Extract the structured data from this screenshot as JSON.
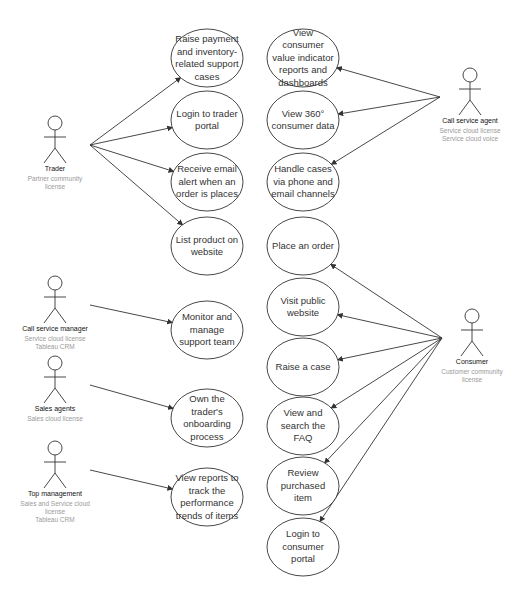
{
  "diagram": {
    "type": "UML use case diagram",
    "actors": [
      {
        "id": "trader",
        "name": "Trader",
        "license": [
          "Partner community",
          "license"
        ],
        "x": 55,
        "y": 145
      },
      {
        "id": "call-service-manager",
        "name": "Call service manager",
        "license": [
          "Service cloud license",
          "Tableau CRM"
        ],
        "x": 55,
        "y": 305
      },
      {
        "id": "sales-agents",
        "name": "Sales agents",
        "license": [
          "Sales cloud license"
        ],
        "x": 55,
        "y": 385
      },
      {
        "id": "top-management",
        "name": "Top management",
        "license": [
          "Sales and Service cloud",
          "license",
          "Tableau CRM"
        ],
        "x": 55,
        "y": 470
      },
      {
        "id": "call-service-agent",
        "name": "Call service agent",
        "license": [
          "Service cloud license",
          "Service cloud voice"
        ],
        "x": 470,
        "y": 97
      },
      {
        "id": "consumer",
        "name": "Consumer",
        "license": [
          "Customer community",
          "license"
        ],
        "x": 472,
        "y": 338
      }
    ],
    "use_cases": [
      {
        "id": "uc1",
        "label": "Raise payment and inventory-related support cases",
        "cx": 207,
        "cy": 58,
        "rx": 36,
        "ry": 29
      },
      {
        "id": "uc2",
        "label": "Login to trader portal",
        "cx": 207,
        "cy": 120,
        "rx": 36,
        "ry": 29
      },
      {
        "id": "uc3",
        "label": "Receive email alert when an order is places",
        "cx": 207,
        "cy": 182,
        "rx": 36,
        "ry": 29
      },
      {
        "id": "uc4",
        "label": "List product on website",
        "cx": 207,
        "cy": 246,
        "rx": 36,
        "ry": 29
      },
      {
        "id": "uc5",
        "label": "Monitor and manage support team",
        "cx": 207,
        "cy": 330,
        "rx": 36,
        "ry": 29
      },
      {
        "id": "uc6",
        "label": "Own the trader's onboarding process",
        "cx": 207,
        "cy": 418,
        "rx": 36,
        "ry": 29
      },
      {
        "id": "uc7",
        "label": "View reports to track the performance trends of items",
        "cx": 207,
        "cy": 497,
        "rx": 36,
        "ry": 29
      },
      {
        "id": "uc8",
        "label": "View consumer value indicator reports and dashboards",
        "cx": 303,
        "cy": 58,
        "rx": 36,
        "ry": 29
      },
      {
        "id": "uc9",
        "label": "View 360° consumer data",
        "cx": 303,
        "cy": 120,
        "rx": 36,
        "ry": 29
      },
      {
        "id": "uc10",
        "label": "Handle cases via phone and email channels",
        "cx": 303,
        "cy": 182,
        "rx": 36,
        "ry": 29
      },
      {
        "id": "uc11",
        "label": "Place an order",
        "cx": 303,
        "cy": 246,
        "rx": 36,
        "ry": 29
      },
      {
        "id": "uc12",
        "label": "Visit public website",
        "cx": 303,
        "cy": 307,
        "rx": 36,
        "ry": 29
      },
      {
        "id": "uc13",
        "label": "Raise a case",
        "cx": 303,
        "cy": 367,
        "rx": 36,
        "ry": 29
      },
      {
        "id": "uc14",
        "label": "View and search the FAQ",
        "cx": 303,
        "cy": 426,
        "rx": 36,
        "ry": 29
      },
      {
        "id": "uc15",
        "label": "Review purchased item",
        "cx": 303,
        "cy": 486,
        "rx": 36,
        "ry": 29
      },
      {
        "id": "uc16",
        "label": "Login to consumer portal",
        "cx": 303,
        "cy": 547,
        "rx": 36,
        "ry": 29
      }
    ],
    "associations": [
      {
        "from": "trader",
        "to": "uc1"
      },
      {
        "from": "trader",
        "to": "uc2"
      },
      {
        "from": "trader",
        "to": "uc3"
      },
      {
        "from": "trader",
        "to": "uc4"
      },
      {
        "from": "call-service-manager",
        "to": "uc5"
      },
      {
        "from": "sales-agents",
        "to": "uc6"
      },
      {
        "from": "top-management",
        "to": "uc7"
      },
      {
        "from": "call-service-agent",
        "to": "uc8"
      },
      {
        "from": "call-service-agent",
        "to": "uc9"
      },
      {
        "from": "call-service-agent",
        "to": "uc10"
      },
      {
        "from": "consumer",
        "to": "uc11"
      },
      {
        "from": "consumer",
        "to": "uc12"
      },
      {
        "from": "consumer",
        "to": "uc13"
      },
      {
        "from": "consumer",
        "to": "uc14"
      },
      {
        "from": "consumer",
        "to": "uc15"
      },
      {
        "from": "consumer",
        "to": "uc16"
      }
    ]
  },
  "colors": {
    "line": "#333333",
    "text": "#333333",
    "actor_name": "#111111",
    "license": "#9a9a9a",
    "background": "#ffffff"
  }
}
